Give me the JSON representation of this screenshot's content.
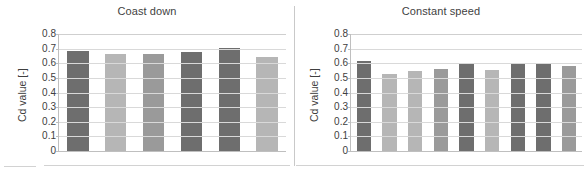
{
  "figure": {
    "type": "grouped-bar-figure",
    "panel_count": 2
  },
  "axis": {
    "ylabel": "Cd value [-]",
    "ticks": [
      "0.8",
      "0.7",
      "0.6",
      "0.5",
      "0.4",
      "0.3",
      "0.2",
      "0.1",
      "0"
    ],
    "ymin": 0,
    "ymax": 0.8,
    "tick_step": 0.1
  },
  "colors": {
    "bar_dark": "#6e6e6e",
    "bar_medium": "#9a9a9a",
    "bar_light": "#b6b6b6",
    "gridline": "#d9d9d9",
    "axis_line": "#bfbfbf",
    "text": "#3f3f3f"
  },
  "chart_data": [
    {
      "type": "bar",
      "title": "Coast down",
      "xlabel": "",
      "ylabel": "Cd value [-]",
      "ylim": [
        0,
        0.8
      ],
      "ytick_step": 0.1,
      "grid": true,
      "legend": "none",
      "categories": [
        "1",
        "2",
        "3",
        "4",
        "5",
        "6"
      ],
      "values": [
        0.685,
        0.665,
        0.663,
        0.675,
        0.702,
        0.64
      ],
      "bar_colors": [
        "#6e6e6e",
        "#b6b6b6",
        "#9a9a9a",
        "#6e6e6e",
        "#6e6e6e",
        "#b6b6b6"
      ]
    },
    {
      "type": "bar",
      "title": "Constant speed",
      "xlabel": "",
      "ylabel": "Cd value [-]",
      "ylim": [
        0,
        0.8
      ],
      "ytick_step": 0.1,
      "grid": true,
      "legend": "none",
      "categories": [
        "1",
        "2",
        "3",
        "4",
        "5",
        "6",
        "7",
        "8",
        "9"
      ],
      "values": [
        0.617,
        0.525,
        0.545,
        0.563,
        0.605,
        0.552,
        0.603,
        0.6,
        0.578
      ],
      "bar_colors": [
        "#6e6e6e",
        "#b6b6b6",
        "#b6b6b6",
        "#9a9a9a",
        "#6e6e6e",
        "#b6b6b6",
        "#6e6e6e",
        "#6e6e6e",
        "#9a9a9a"
      ]
    }
  ]
}
